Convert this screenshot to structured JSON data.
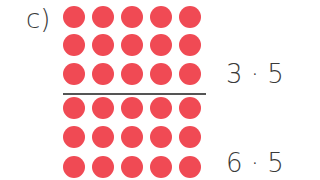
{
  "part_label": "c)",
  "dot_color": "#f04a54",
  "dot_grid": {
    "rows": 6,
    "columns": 5,
    "divider_after_row": 3
  },
  "expressions": [
    {
      "text": "3 · 5",
      "row": 3
    },
    {
      "text": "6 · 5",
      "row": 6
    }
  ]
}
